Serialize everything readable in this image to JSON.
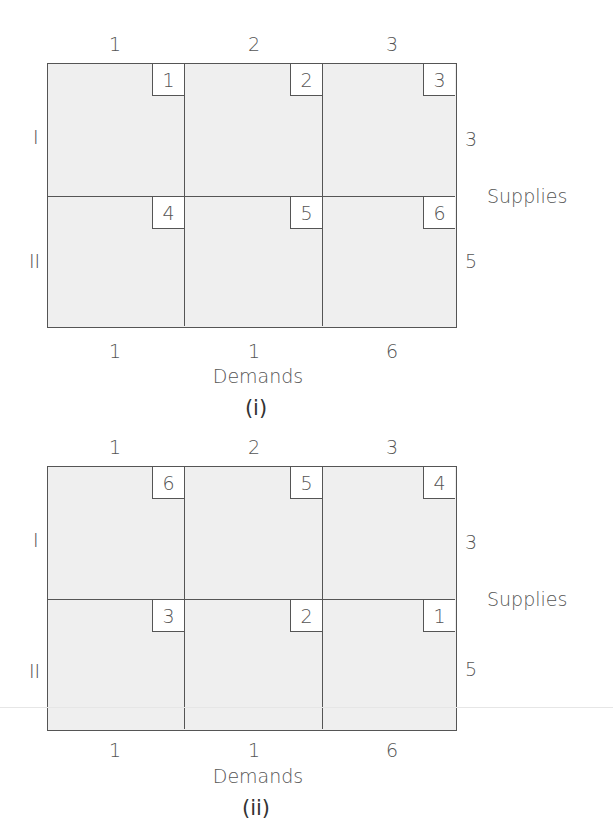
{
  "diagrams": [
    {
      "caption": "(i)",
      "column_labels": [
        "1",
        "2",
        "3"
      ],
      "row_labels": [
        "I",
        "II"
      ],
      "costs": [
        [
          "1",
          "2",
          "3"
        ],
        [
          "4",
          "5",
          "6"
        ]
      ],
      "supplies": [
        "3",
        "5"
      ],
      "supplies_label": "Supplies",
      "demands": [
        "1",
        "1",
        "6"
      ],
      "demands_label": "Demands"
    },
    {
      "caption": "(ii)",
      "column_labels": [
        "1",
        "2",
        "3"
      ],
      "row_labels": [
        "I",
        "II"
      ],
      "costs": [
        [
          "6",
          "5",
          "4"
        ],
        [
          "3",
          "2",
          "1"
        ]
      ],
      "supplies": [
        "3",
        "5"
      ],
      "supplies_label": "Supplies",
      "demands": [
        "1",
        "1",
        "6"
      ],
      "demands_label": "Demands"
    }
  ],
  "colors": {
    "cell_fill": "#efefef",
    "border": "#555555",
    "cost_box": "#ffffff"
  }
}
